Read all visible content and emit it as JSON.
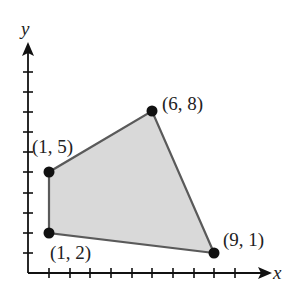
{
  "diagram": {
    "type": "coordinate-plane-polygon",
    "axes": {
      "x_label": "x",
      "y_label": "y",
      "x_ticks": 11,
      "y_ticks": 10
    },
    "polygon": {
      "fill": "#d8d8d8",
      "stroke": "#555555",
      "vertices": [
        {
          "x": 1,
          "y": 2,
          "label": "(1, 2)"
        },
        {
          "x": 1,
          "y": 5,
          "label": "(1, 5)"
        },
        {
          "x": 6,
          "y": 8,
          "label": "(6, 8)"
        },
        {
          "x": 9,
          "y": 1,
          "label": "(9, 1)"
        }
      ]
    }
  }
}
